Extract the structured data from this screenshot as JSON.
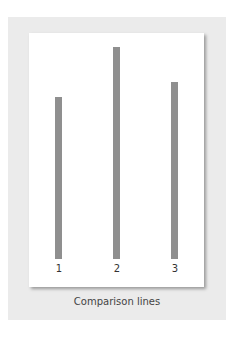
{
  "figure": {
    "caption": "Comparison lines",
    "colors": {
      "frame_background": "#ebebeb",
      "card_background": "#ffffff",
      "line_color": "#8f8f8f"
    },
    "lines": [
      {
        "label": "1",
        "relative_length": 162
      },
      {
        "label": "2",
        "relative_length": 212
      },
      {
        "label": "3",
        "relative_length": 177
      }
    ]
  }
}
